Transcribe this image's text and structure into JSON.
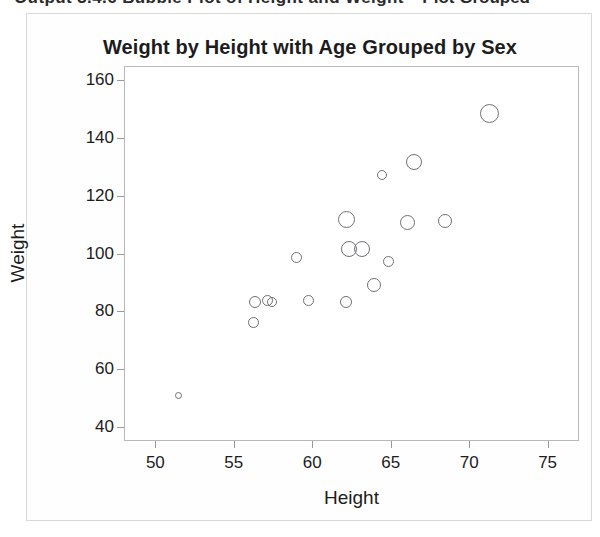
{
  "page": {
    "top_cut_text_left": "Output 3.4.6 Bubble Plot of Height and Weight",
    "top_cut_text_right": "Plot Grouped"
  },
  "figure": {
    "title": "Weight by Height with Age Grouped by Sex",
    "x_axis_title": "Height",
    "y_axis_title": "Weight"
  },
  "chart_data": {
    "type": "scatter",
    "title": "Weight by Height with Age Grouped by Sex",
    "xlabel": "Height",
    "ylabel": "Weight",
    "xlim": [
      48,
      77
    ],
    "ylim": [
      35,
      165
    ],
    "xticks": [
      50,
      55,
      60,
      65,
      70,
      75
    ],
    "yticks": [
      40,
      60,
      80,
      100,
      120,
      140,
      160
    ],
    "grid": false,
    "legend": "none",
    "marker": "open-circle",
    "marker_color": "#6f7176",
    "size_encodes": "Age",
    "points": [
      {
        "x": 51.4,
        "y": 51.0,
        "size": 7
      },
      {
        "x": 56.2,
        "y": 76.5,
        "size": 11
      },
      {
        "x": 56.3,
        "y": 83.5,
        "size": 12
      },
      {
        "x": 57.1,
        "y": 84.0,
        "size": 11
      },
      {
        "x": 57.4,
        "y": 83.5,
        "size": 10
      },
      {
        "x": 58.9,
        "y": 99.0,
        "size": 11
      },
      {
        "x": 59.7,
        "y": 84.0,
        "size": 11
      },
      {
        "x": 62.1,
        "y": 83.5,
        "size": 12
      },
      {
        "x": 62.1,
        "y": 112.0,
        "size": 17
      },
      {
        "x": 62.3,
        "y": 102.0,
        "size": 16
      },
      {
        "x": 63.1,
        "y": 102.0,
        "size": 16
      },
      {
        "x": 63.9,
        "y": 89.5,
        "size": 14
      },
      {
        "x": 64.4,
        "y": 127.5,
        "size": 10
      },
      {
        "x": 64.8,
        "y": 97.5,
        "size": 11
      },
      {
        "x": 66.0,
        "y": 111.0,
        "size": 15
      },
      {
        "x": 66.4,
        "y": 132.0,
        "size": 16
      },
      {
        "x": 68.4,
        "y": 111.5,
        "size": 14
      },
      {
        "x": 71.2,
        "y": 149.0,
        "size": 19
      }
    ]
  }
}
